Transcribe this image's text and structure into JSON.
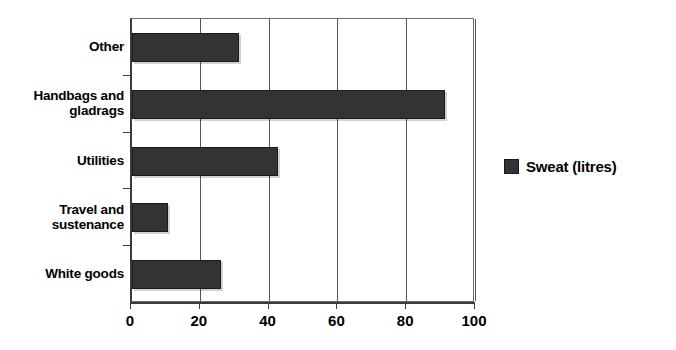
{
  "chart_data": {
    "type": "bar",
    "orientation": "horizontal",
    "title": "",
    "xlabel": "",
    "ylabel": "",
    "categories": [
      "White goods",
      "Travel and sustenance",
      "Utilities",
      "Handbags and gladrags",
      "Other"
    ],
    "series": [
      {
        "name": "Sweat (litres)",
        "values": [
          26,
          10.5,
          42.5,
          91,
          31
        ],
        "color": "#333333"
      }
    ],
    "xlim": [
      0,
      100
    ],
    "xticks": [
      0,
      20,
      40,
      60,
      80,
      100
    ],
    "xtick_labels": [
      "0",
      "20",
      "40",
      "60",
      "80",
      "100"
    ],
    "grid": "vertical",
    "legend_position": "right"
  },
  "legend": {
    "entries": [
      {
        "label": "Sweat (litres)",
        "swatch_color": "#333333"
      }
    ]
  },
  "axis": {
    "category_labels": [
      {
        "lines": [
          "Other"
        ]
      },
      {
        "lines": [
          "Handbags and",
          "gladrags"
        ]
      },
      {
        "lines": [
          "Utilities"
        ]
      },
      {
        "lines": [
          "Travel and",
          "sustenance"
        ]
      },
      {
        "lines": [
          "White goods"
        ]
      }
    ],
    "tick_labels": [
      "0",
      "20",
      "40",
      "60",
      "80",
      "100"
    ]
  },
  "colors": {
    "bar_fill": "#333333",
    "bar_stroke": "#1a1a1a",
    "gridline": "#555555",
    "axis": "#3b3b3b",
    "background": "#ffffff",
    "text": "#000000"
  }
}
